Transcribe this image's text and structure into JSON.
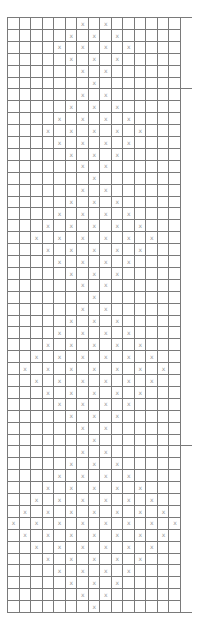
{
  "chart": {
    "columns": 15,
    "rows": 50,
    "mark_symbol": "x",
    "grid_color": "#7a7a7a",
    "mark_color": "#9a9a9a",
    "section_markers_after_rows": [
      0,
      6,
      36,
      50
    ],
    "pattern": [
      "......x.x......",
      ".....x.x.x.....",
      "....x.x.x.x....",
      ".....x.x.x.....",
      "......x.x......",
      ".......x.......",
      "......x.x......",
      ".....x.x.x.....",
      "....x.x.x.x....",
      "...x.x.x.x.x...",
      "....x.x.x.x....",
      ".....x.x.x.....",
      "......x.x......",
      ".......x.......",
      "......x.x......",
      ".....x.x.x.....",
      "....x.x.x.x....",
      "...x.x.x.x.x...",
      "..x.x.x.x.x.x..",
      "...x.x.x.x.x...",
      "....x.x.x.x....",
      ".....x.x.x.....",
      "......x.x......",
      ".......x.......",
      "......x.x......",
      ".....x.x.x.....",
      "....x.x.x.x....",
      "...x.x.x.x.x...",
      "..x.x.x.x.x.x..",
      ".x.x.x.x.x.x.x.",
      "..x.x.x.x.x.x..",
      "...x.x.x.x.x...",
      "....x.x.x.x....",
      ".....x.x.x.....",
      "......x.x......",
      ".......x.......",
      "......x.x......",
      ".....x.x.x.....",
      "....x.x.x.x....",
      "...x.x.x.x.x...",
      "..x.x.x.x.x.x..",
      ".x.x.x.x.x.x.x.",
      "x.x.x.x.x.x.x.x",
      ".x.x.x.x.x.x.x.",
      "..x.x.x.x.x.x..",
      "...x.x.x.x.x...",
      "....x.x.x.x....",
      ".....x.x.x.....",
      "......x.x......",
      ".......x......."
    ]
  }
}
